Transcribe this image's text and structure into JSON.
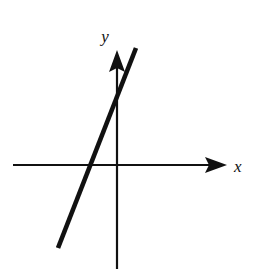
{
  "figure": {
    "background_color": "#ffffff",
    "ink_color": "#111111",
    "width": 260,
    "height": 269
  },
  "axes": {
    "x_axis": {
      "label": "x",
      "label_x": 234,
      "label_y": 172,
      "start_x": 13,
      "end_x": 227,
      "y": 165,
      "stroke_width": 2.2,
      "arrow": "right-arrowhead"
    },
    "y_axis": {
      "label": "y",
      "label_x": 105,
      "label_y": 42,
      "x": 117,
      "start_y": 50,
      "end_y": 269,
      "stroke_width": 2.2,
      "arrow": "up-arrowhead"
    },
    "origin": {
      "x": 117,
      "y": 165
    }
  },
  "chart_data": {
    "type": "line",
    "title": "",
    "xlabel": "x",
    "ylabel": "y",
    "grid": false,
    "legend": null,
    "axis_style": "arrowed-cartesian-axes",
    "origin_px": {
      "x": 117,
      "y": 165
    },
    "series": [
      {
        "name": "line",
        "stroke_color": "#111111",
        "stroke_width": 4.6,
        "description": "steep positively-sloped straight line",
        "x_intercept_px": 94,
        "y_intercept_px": 92,
        "slope_screen": -2.564,
        "points_px": [
          {
            "x": 58,
            "y": 248
          },
          {
            "x": 136,
            "y": 48
          }
        ]
      }
    ]
  }
}
